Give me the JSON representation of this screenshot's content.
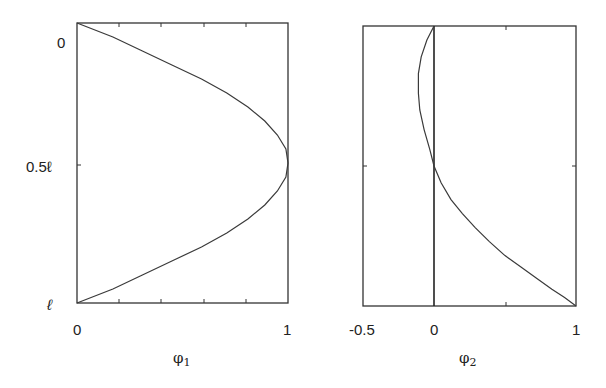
{
  "chart_data": [
    {
      "type": "line",
      "title": "",
      "xlabel": "φ1",
      "xlabel_base": "φ",
      "xlabel_sub": "1",
      "ylabel": "",
      "xlim": [
        0,
        1
      ],
      "ylim": [
        "0",
        "ℓ"
      ],
      "y_inverted": true,
      "x_ticks": [
        "0",
        "1"
      ],
      "y_ticks": [
        "0",
        "0.5ℓ",
        "ℓ"
      ],
      "series": [
        {
          "name": "φ1",
          "x": [
            0,
            0.17,
            0.31,
            0.45,
            0.59,
            0.71,
            0.81,
            0.89,
            0.95,
            0.99,
            1.0,
            0.99,
            0.95,
            0.89,
            0.81,
            0.71,
            0.59,
            0.45,
            0.31,
            0.17,
            0
          ],
          "y": [
            0,
            0.05,
            0.1,
            0.15,
            0.2,
            0.25,
            0.3,
            0.35,
            0.4,
            0.45,
            0.5,
            0.55,
            0.6,
            0.65,
            0.7,
            0.75,
            0.8,
            0.85,
            0.9,
            0.95,
            1.0
          ]
        }
      ]
    },
    {
      "type": "line",
      "title": "",
      "xlabel": "φ2",
      "xlabel_base": "φ",
      "xlabel_sub": "2",
      "ylabel": "",
      "xlim": [
        -0.5,
        1
      ],
      "ylim": [
        "0",
        "ℓ"
      ],
      "y_inverted": true,
      "x_ticks": [
        "-0.5",
        "0",
        "1"
      ],
      "y_ticks": [],
      "vertical_reference_line_x": 0,
      "series": [
        {
          "name": "φ2",
          "x": [
            0,
            -0.05,
            -0.09,
            -0.11,
            -0.11,
            -0.1,
            -0.07,
            -0.03,
            0.0,
            0.05,
            0.12,
            0.2,
            0.29,
            0.39,
            0.5,
            0.61,
            0.72,
            0.83,
            0.92,
            1.0
          ],
          "y": [
            0,
            0.05,
            0.11,
            0.17,
            0.24,
            0.3,
            0.37,
            0.44,
            0.5,
            0.56,
            0.62,
            0.67,
            0.72,
            0.77,
            0.82,
            0.86,
            0.9,
            0.94,
            0.97,
            1.0
          ]
        }
      ]
    }
  ],
  "labels": {
    "left_y_top": "0",
    "left_y_mid": "0.5ℓ",
    "left_y_bottom": "ℓ",
    "left_x_min": "0",
    "left_x_max": "1",
    "left_x_axis_base": "φ",
    "left_x_axis_sub": "1",
    "right_x_min": "-0.5",
    "right_x_zero": "0",
    "right_x_max": "1",
    "right_x_axis_base": "φ",
    "right_x_axis_sub": "2"
  },
  "colors": {
    "line": "#3a3a3a",
    "frame": "#333333",
    "background": "#ffffff"
  }
}
